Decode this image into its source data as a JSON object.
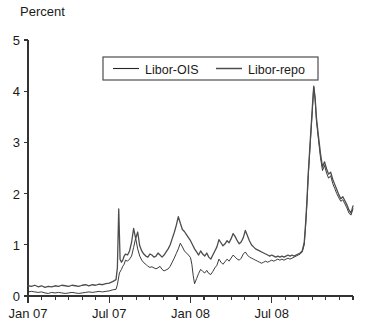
{
  "chart_data": {
    "type": "line",
    "title": "",
    "ylabel": "Percent",
    "xlabel": "",
    "ylim": [
      0,
      5
    ],
    "yticks": [
      0,
      1,
      2,
      3,
      4,
      5
    ],
    "ytick_labels": [
      "0",
      "1",
      "2",
      "3",
      "4",
      "5"
    ],
    "xlim": [
      "2007-01",
      "2008-12"
    ],
    "xticks": [
      "Jan 07",
      "Jul 07",
      "Jan 08",
      "Jul 08"
    ],
    "xtick_positions_months": [
      0,
      6,
      12,
      18
    ],
    "minor_xticks": "monthly",
    "grid": false,
    "legend_position": "top-center",
    "legend_entries": [
      "Libor-OIS",
      "Libor-repo"
    ],
    "series": [
      {
        "name": "Libor-OIS",
        "color": "#262626",
        "linewidth": 0.9,
        "x": [
          0.0,
          0.25,
          0.5,
          0.75,
          1.0,
          1.25,
          1.5,
          1.75,
          2.0,
          2.25,
          2.5,
          2.75,
          3.0,
          3.25,
          3.5,
          3.75,
          4.0,
          4.25,
          4.5,
          4.75,
          5.0,
          5.25,
          5.5,
          5.75,
          6.0,
          6.25,
          6.5,
          6.6,
          6.75,
          6.9,
          7.0,
          7.1,
          7.2,
          7.35,
          7.5,
          7.65,
          7.8,
          7.95,
          8.1,
          8.25,
          8.4,
          8.55,
          8.7,
          8.85,
          9.0,
          9.15,
          9.3,
          9.45,
          9.6,
          9.75,
          9.9,
          10.05,
          10.2,
          10.35,
          10.5,
          10.65,
          10.8,
          10.95,
          11.1,
          11.25,
          11.4,
          11.55,
          11.7,
          11.85,
          12.0,
          12.1,
          12.2,
          12.3,
          12.45,
          12.6,
          12.75,
          12.9,
          13.05,
          13.2,
          13.35,
          13.5,
          13.65,
          13.8,
          13.95,
          14.1,
          14.25,
          14.4,
          14.55,
          14.7,
          14.85,
          15.0,
          15.15,
          15.3,
          15.45,
          15.6,
          15.75,
          15.9,
          16.05,
          16.2,
          16.35,
          16.5,
          16.65,
          16.8,
          16.95,
          17.1,
          17.25,
          17.4,
          17.55,
          17.7,
          17.85,
          18.0,
          18.15,
          18.3,
          18.45,
          18.6,
          18.75,
          18.9,
          19.05,
          19.2,
          19.35,
          19.5,
          19.65,
          19.8,
          19.95,
          20.1,
          20.25,
          20.4,
          20.5,
          20.6,
          20.7,
          20.8,
          20.9,
          21.0,
          21.1,
          21.2,
          21.3,
          21.45,
          21.6,
          21.75,
          21.9,
          22.05,
          22.2,
          22.35,
          22.5,
          22.65,
          22.8,
          22.95,
          23.1,
          23.25,
          23.4,
          23.55,
          23.7,
          23.85,
          24.0
        ],
        "y": [
          0.08,
          0.09,
          0.08,
          0.07,
          0.08,
          0.06,
          0.05,
          0.07,
          0.06,
          0.07,
          0.06,
          0.05,
          0.06,
          0.07,
          0.06,
          0.05,
          0.06,
          0.07,
          0.08,
          0.07,
          0.08,
          0.09,
          0.08,
          0.09,
          0.1,
          0.12,
          0.13,
          0.22,
          0.45,
          0.52,
          0.58,
          0.62,
          0.7,
          0.68,
          0.72,
          0.78,
          0.95,
          1.13,
          0.92,
          0.78,
          0.7,
          0.65,
          0.62,
          0.58,
          0.56,
          0.57,
          0.55,
          0.53,
          0.55,
          0.58,
          0.52,
          0.49,
          0.51,
          0.53,
          0.58,
          0.66,
          0.74,
          0.83,
          0.92,
          1.03,
          0.96,
          0.88,
          0.84,
          0.8,
          0.75,
          0.62,
          0.4,
          0.24,
          0.34,
          0.44,
          0.52,
          0.48,
          0.45,
          0.5,
          0.44,
          0.42,
          0.48,
          0.55,
          0.6,
          0.72,
          0.66,
          0.62,
          0.67,
          0.72,
          0.68,
          0.74,
          0.8,
          0.76,
          0.72,
          0.7,
          0.74,
          0.82,
          0.86,
          0.8,
          0.76,
          0.74,
          0.72,
          0.7,
          0.68,
          0.66,
          0.64,
          0.66,
          0.68,
          0.66,
          0.68,
          0.7,
          0.68,
          0.7,
          0.72,
          0.7,
          0.72,
          0.7,
          0.72,
          0.74,
          0.72,
          0.74,
          0.76,
          0.78,
          0.8,
          0.82,
          0.86,
          1.0,
          1.35,
          1.8,
          2.35,
          2.78,
          3.2,
          3.62,
          4.08,
          3.85,
          3.42,
          3.05,
          2.7,
          2.45,
          2.55,
          2.4,
          2.3,
          2.35,
          2.2,
          2.1,
          2.0,
          1.92,
          1.85,
          1.88,
          1.8,
          1.72,
          1.62,
          1.58,
          1.7
        ]
      },
      {
        "name": "Libor-repo",
        "color": "#4d4d4d",
        "linewidth": 1.3,
        "x": [
          0.0,
          0.25,
          0.5,
          0.75,
          1.0,
          1.25,
          1.5,
          1.75,
          2.0,
          2.25,
          2.5,
          2.75,
          3.0,
          3.25,
          3.5,
          3.75,
          4.0,
          4.25,
          4.5,
          4.75,
          5.0,
          5.25,
          5.5,
          5.75,
          6.0,
          6.25,
          6.5,
          6.6,
          6.7,
          6.8,
          6.9,
          7.0,
          7.1,
          7.2,
          7.35,
          7.5,
          7.65,
          7.8,
          7.95,
          8.1,
          8.25,
          8.4,
          8.55,
          8.7,
          8.85,
          9.0,
          9.15,
          9.3,
          9.45,
          9.6,
          9.75,
          9.9,
          10.05,
          10.2,
          10.35,
          10.5,
          10.65,
          10.8,
          10.95,
          11.1,
          11.25,
          11.4,
          11.55,
          11.7,
          11.85,
          12.0,
          12.15,
          12.3,
          12.45,
          12.6,
          12.75,
          12.9,
          13.05,
          13.2,
          13.35,
          13.5,
          13.65,
          13.8,
          13.95,
          14.1,
          14.25,
          14.4,
          14.55,
          14.7,
          14.85,
          15.0,
          15.15,
          15.3,
          15.45,
          15.6,
          15.75,
          15.9,
          16.05,
          16.2,
          16.35,
          16.5,
          16.65,
          16.8,
          16.95,
          17.1,
          17.25,
          17.4,
          17.55,
          17.7,
          17.85,
          18.0,
          18.15,
          18.3,
          18.45,
          18.6,
          18.75,
          18.9,
          19.05,
          19.2,
          19.35,
          19.5,
          19.65,
          19.8,
          19.95,
          20.1,
          20.25,
          20.4,
          20.5,
          20.6,
          20.7,
          20.8,
          20.9,
          21.0,
          21.1,
          21.2,
          21.3,
          21.45,
          21.6,
          21.75,
          21.9,
          22.05,
          22.2,
          22.35,
          22.5,
          22.65,
          22.8,
          22.95,
          23.1,
          23.25,
          23.4,
          23.55,
          23.7,
          23.85,
          24.0
        ],
        "y": [
          0.2,
          0.19,
          0.21,
          0.18,
          0.2,
          0.17,
          0.19,
          0.18,
          0.2,
          0.19,
          0.21,
          0.2,
          0.19,
          0.21,
          0.2,
          0.19,
          0.21,
          0.22,
          0.2,
          0.22,
          0.21,
          0.23,
          0.22,
          0.24,
          0.25,
          0.28,
          0.32,
          0.55,
          1.7,
          0.72,
          0.66,
          0.7,
          0.78,
          0.82,
          0.8,
          0.88,
          1.05,
          1.32,
          1.12,
          1.25,
          0.98,
          0.88,
          0.82,
          0.78,
          0.76,
          0.82,
          0.8,
          0.76,
          0.78,
          0.84,
          0.8,
          0.76,
          0.8,
          0.86,
          0.92,
          1.0,
          1.12,
          1.24,
          1.38,
          1.55,
          1.42,
          1.3,
          1.26,
          1.2,
          1.14,
          1.08,
          1.0,
          0.92,
          0.86,
          0.8,
          0.88,
          0.82,
          0.78,
          0.84,
          0.76,
          0.72,
          0.8,
          0.88,
          0.96,
          1.1,
          1.04,
          0.98,
          1.02,
          1.08,
          1.04,
          1.12,
          1.22,
          1.16,
          1.08,
          1.02,
          1.06,
          1.14,
          1.28,
          1.18,
          1.08,
          1.0,
          0.96,
          0.92,
          0.9,
          0.88,
          0.86,
          0.84,
          0.82,
          0.8,
          0.78,
          0.8,
          0.78,
          0.76,
          0.78,
          0.76,
          0.78,
          0.76,
          0.78,
          0.8,
          0.78,
          0.8,
          0.78,
          0.8,
          0.82,
          0.84,
          0.88,
          1.05,
          1.42,
          1.88,
          2.42,
          2.85,
          3.28,
          3.7,
          4.1,
          3.88,
          3.48,
          3.12,
          2.78,
          2.52,
          2.62,
          2.48,
          2.38,
          2.42,
          2.28,
          2.18,
          2.08,
          1.98,
          1.9,
          1.94,
          1.86,
          1.78,
          1.68,
          1.62,
          1.76
        ]
      }
    ],
    "annotations": [
      {
        "label": "Aug 2007 Libor-repo spike",
        "value": 1.7
      },
      {
        "label": "Oct 2008 peak",
        "value": 4.1
      },
      {
        "label": "Sep 2008 Libor-OIS spike",
        "value": 2.78
      }
    ]
  },
  "axes": {
    "y_title": "Percent"
  }
}
